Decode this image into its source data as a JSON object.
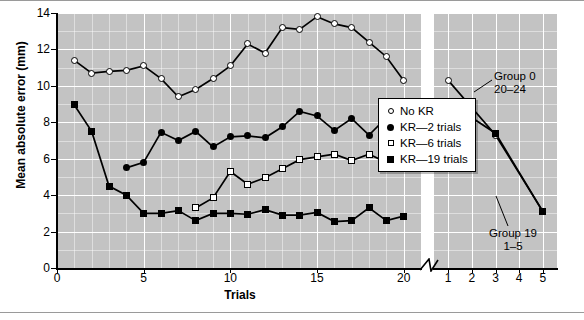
{
  "chart_data": {
    "type": "line",
    "title": "",
    "xlabel": "Trials",
    "ylabel": "Mean absolute error (mm)",
    "ylim": [
      0,
      14
    ],
    "yticks": [
      0,
      2,
      4,
      6,
      8,
      10,
      12,
      14
    ],
    "grid": true,
    "legend_position": "inside-right",
    "panels": [
      {
        "name": "acquisition",
        "xlim": [
          0,
          21
        ],
        "xticks": [
          0,
          5,
          10,
          15,
          20
        ],
        "x": [
          1,
          2,
          3,
          4,
          5,
          6,
          7,
          8,
          9,
          10,
          11,
          12,
          13,
          14,
          15,
          16,
          17,
          18,
          19,
          20
        ],
        "series": [
          {
            "name": "No KR",
            "marker": "open-circle",
            "values": [
              11.4,
              10.7,
              10.8,
              10.85,
              11.1,
              10.4,
              9.4,
              9.8,
              10.4,
              11.1,
              12.3,
              11.8,
              13.2,
              13.1,
              13.8,
              13.4,
              13.2,
              12.4,
              11.6,
              10.3
            ]
          },
          {
            "name": "KR—2 trials",
            "marker": "filled-circle",
            "values": [
              null,
              null,
              null,
              5.5,
              5.8,
              7.45,
              7.0,
              7.5,
              6.65,
              7.2,
              7.25,
              7.15,
              7.75,
              8.6,
              8.35,
              7.55,
              8.2,
              7.3,
              8.25,
              6.95
            ]
          },
          {
            "name": "KR—6 trials",
            "marker": "open-square",
            "values": [
              null,
              null,
              null,
              null,
              null,
              null,
              null,
              3.3,
              3.85,
              5.3,
              4.6,
              4.95,
              5.45,
              5.95,
              6.1,
              6.25,
              5.9,
              6.25,
              5.8,
              6.0
            ]
          },
          {
            "name": "KR—19 trials",
            "marker": "filled-square",
            "values": [
              8.95,
              7.5,
              4.5,
              4.0,
              3.0,
              3.0,
              3.15,
              2.6,
              3.0,
              3.0,
              2.95,
              3.2,
              2.9,
              2.9,
              3.05,
              2.55,
              2.6,
              3.3,
              2.6,
              2.85
            ]
          }
        ]
      },
      {
        "name": "retention",
        "xlim": [
          0.4,
          5.6
        ],
        "xticks": [
          1,
          2,
          3,
          4,
          5
        ],
        "x": [
          1,
          2,
          3,
          4,
          5
        ],
        "series": [
          {
            "name": "No KR",
            "marker": "open-circle",
            "values": [
              10.3,
              null,
              7.3,
              null,
              3.1
            ]
          },
          {
            "name": "KR—19 trials",
            "marker": "filled-square",
            "values": [
              9.1,
              null,
              7.4,
              null,
              3.1
            ]
          }
        ],
        "annotations": [
          {
            "name": "group-0-annotation",
            "line1": "Group 0",
            "line2": "20–24"
          },
          {
            "name": "group-19-annotation",
            "line1": "Group 19",
            "line2": "1–5"
          }
        ]
      }
    ],
    "legend": [
      {
        "label": "No KR",
        "marker": "open-circle"
      },
      {
        "label": "KR—2 trials",
        "marker": "filled-circle"
      },
      {
        "label": "KR—6 trials",
        "marker": "open-square"
      },
      {
        "label": "KR—19 trials",
        "marker": "filled-square"
      }
    ],
    "colors": {
      "plot_background": "#c3c3c3",
      "gridline": "#ffffff",
      "axis": "#000000",
      "marker_fill_light": "#ffffff",
      "marker_fill_dark": "#000000"
    }
  },
  "yticklabels": [
    "14",
    "12",
    "10",
    "8",
    "6",
    "4",
    "2",
    "0"
  ],
  "xticklabels_left": [
    "0",
    "5",
    "10",
    "15",
    "20"
  ],
  "xticklabels_right": [
    "1",
    "2",
    "3",
    "4",
    "5"
  ],
  "axis_titles": {
    "x": "Trials",
    "y": "Mean absolute error (mm)"
  },
  "legend_labels": {
    "no_kr": "No KR",
    "kr_2": "KR—2 trials",
    "kr_6": "KR—6 trials",
    "kr_19": "KR—19 trials"
  },
  "annotations": {
    "group0_line1": "Group 0",
    "group0_line2": "20–24",
    "group19_line1": "Group 19",
    "group19_line2": "1–5"
  }
}
